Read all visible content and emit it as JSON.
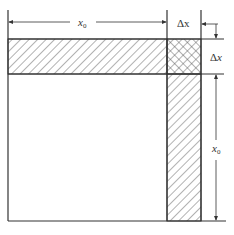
{
  "diagram": {
    "labels": {
      "top_width": "x",
      "top_width_sub": "0",
      "top_delta": "Δx",
      "right_delta_symbol": "Δ",
      "right_delta_var": "x",
      "right_height": "x",
      "right_height_sub": "0"
    },
    "regions": [
      {
        "name": "original-square",
        "fill": "none"
      },
      {
        "name": "top-strip",
        "fill": "diagonal-hatch"
      },
      {
        "name": "right-strip",
        "fill": "diagonal-hatch"
      },
      {
        "name": "corner-square",
        "fill": "cross-hatch"
      }
    ],
    "colors": {
      "line": "#333333",
      "hatch": "#555555",
      "background": "#ffffff"
    }
  }
}
